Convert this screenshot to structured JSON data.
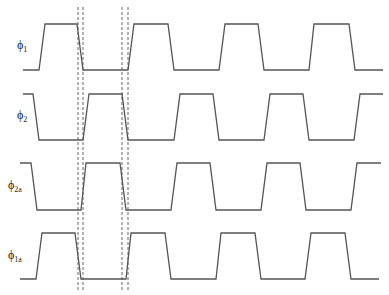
{
  "diagram": {
    "type": "clock-timing-diagram",
    "signals": [
      {
        "name": "phi1",
        "symbol": "ϕ",
        "subscript": "1",
        "start_level": "low",
        "edges": [
          {
            "type": "rise",
            "t": [
              39,
              45
            ]
          },
          {
            "type": "fall",
            "t": [
              77,
              83
            ]
          },
          {
            "type": "rise",
            "t": [
              128,
              134
            ]
          },
          {
            "type": "fall",
            "t": [
              168,
              174
            ]
          },
          {
            "type": "rise",
            "t": [
              219,
              225
            ]
          },
          {
            "type": "fall",
            "t": [
              258,
              264
            ]
          },
          {
            "type": "rise",
            "t": [
              309,
              314
            ]
          },
          {
            "type": "fall",
            "t": [
              349,
              355
            ]
          }
        ],
        "t_start": 23,
        "t_end": 383
      },
      {
        "name": "phi2",
        "symbol": "ϕ",
        "subscript": "2",
        "start_level": "high",
        "edges": [
          {
            "type": "fall",
            "t": [
              33,
              39
            ]
          },
          {
            "type": "rise",
            "t": [
              83,
              89
            ]
          },
          {
            "type": "fall",
            "t": [
              122,
              128
            ]
          },
          {
            "type": "rise",
            "t": [
              174,
              180
            ]
          },
          {
            "type": "fall",
            "t": [
              213,
              219
            ]
          },
          {
            "type": "rise",
            "t": [
              264,
              270
            ]
          },
          {
            "type": "fall",
            "t": [
              303,
              309
            ]
          },
          {
            "type": "rise",
            "t": [
              354,
              360
            ]
          }
        ],
        "t_start": 23,
        "t_end": 383
      },
      {
        "name": "phi2a",
        "symbol": "ϕ",
        "subscript": "2a",
        "start_level": "high",
        "edges": [
          {
            "type": "fall",
            "t": [
              31,
              37
            ]
          },
          {
            "type": "rise",
            "t": [
              81,
              86
            ]
          },
          {
            "type": "fall",
            "t": [
              120,
              126
            ]
          },
          {
            "type": "rise",
            "t": [
              171,
              177
            ]
          },
          {
            "type": "fall",
            "t": [
              210,
              216
            ]
          },
          {
            "type": "rise",
            "t": [
              261,
              267
            ]
          },
          {
            "type": "fall",
            "t": [
              300,
              306
            ]
          },
          {
            "type": "rise",
            "t": [
              351,
              357
            ]
          }
        ],
        "t_start": 20,
        "t_end": 381
      },
      {
        "name": "phi1a",
        "symbol": "ϕ",
        "subscript": "1a",
        "start_level": "low",
        "edges": [
          {
            "type": "rise",
            "t": [
              36,
              42
            ]
          },
          {
            "type": "fall",
            "t": [
              75,
              81
            ]
          },
          {
            "type": "rise",
            "t": [
              126,
              131
            ]
          },
          {
            "type": "fall",
            "t": [
              165,
              171
            ]
          },
          {
            "type": "rise",
            "t": [
              216,
              221
            ]
          },
          {
            "type": "fall",
            "t": [
              255,
              261
            ]
          },
          {
            "type": "rise",
            "t": [
              305,
              311
            ]
          },
          {
            "type": "fall",
            "t": [
              345,
              351
            ]
          }
        ],
        "t_start": 20,
        "t_end": 379
      }
    ],
    "markers": [
      78,
      83,
      122,
      128
    ]
  }
}
